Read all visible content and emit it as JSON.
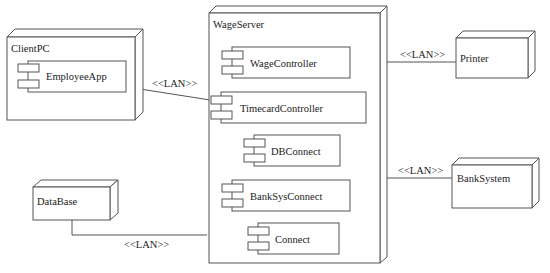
{
  "diagram": {
    "type": "UML deployment diagram",
    "nodes": [
      {
        "id": "clientpc",
        "label": "ClientPC",
        "components": [
          "EmployeeApp"
        ]
      },
      {
        "id": "wageserver",
        "label": "WageServer",
        "components": [
          "WageController",
          "TimecardController",
          "DBConnect",
          "BankSysConnect",
          "Connect"
        ]
      },
      {
        "id": "printer",
        "label": "Printer",
        "components": []
      },
      {
        "id": "banksystem",
        "label": "BankSystem",
        "components": []
      },
      {
        "id": "database",
        "label": "DataBase",
        "components": []
      }
    ],
    "connections": [
      {
        "from": "clientpc",
        "to": "wageserver",
        "label": "<<LAN>>"
      },
      {
        "from": "wageserver",
        "to": "printer",
        "label": "<<LAN>>"
      },
      {
        "from": "wageserver",
        "to": "banksystem",
        "label": "<<LAN>>"
      },
      {
        "from": "database",
        "to": "wageserver",
        "label": "<<LAN>>"
      }
    ]
  },
  "labels": {
    "clientpc": "ClientPC",
    "employeeapp": "EmployeeApp",
    "wageserver": "WageServer",
    "wagecontroller": "WageController",
    "timecardcontroller": "TimecardController",
    "dbconnect": "DBConnect",
    "banksysconnect": "BankSysConnect",
    "connect": "Connect",
    "printer": "Printer",
    "banksystem": "BankSystem",
    "database": "DataBase",
    "lan_client": "<<LAN>>",
    "lan_printer": "<<LAN>>",
    "lan_bank": "<<LAN>>",
    "lan_db": "<<LAN>>"
  }
}
